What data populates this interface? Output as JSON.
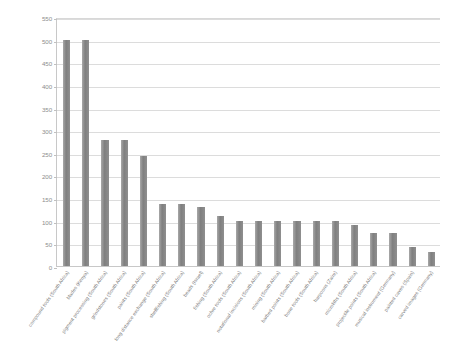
{
  "chart_data": {
    "type": "bar",
    "title": "",
    "subtitle": "",
    "xlabel": "",
    "ylabel": "",
    "ylim": [
      0,
      550
    ],
    "ytick_step": 50,
    "yticks": [
      "550",
      "500",
      "450",
      "400",
      "350",
      "300",
      "250",
      "200",
      "150",
      "100",
      "50",
      "0"
    ],
    "grid": true,
    "legend": false,
    "bar_color": "#8a8a8a",
    "categories": [
      "compound tools (South Africa)",
      "blades (Kenya)",
      "pigment processing (South Africa)",
      "grindstones (South Africa)",
      "paints (South Africa)",
      "long distance exchange (South Africa)",
      "shellfishing (South Africa)",
      "beads (Israel)",
      "fishing (South Africa)",
      "ochre tools (South Africa)",
      "notational incisions (South Africa)",
      "mining (South Africa)",
      "barbed points (South Africa)",
      "bone tools (South Africa)",
      "harpoons (Zaire)",
      "microliths (South Africa)",
      "projectile points (South Africa)",
      "musical instrument (Germany)",
      "painted caves (Spain)",
      "carved images (Germany)"
    ],
    "values": [
      500,
      500,
      278,
      278,
      242,
      137,
      137,
      130,
      110,
      100,
      100,
      100,
      100,
      100,
      100,
      90,
      72,
      72,
      43,
      32
    ]
  }
}
